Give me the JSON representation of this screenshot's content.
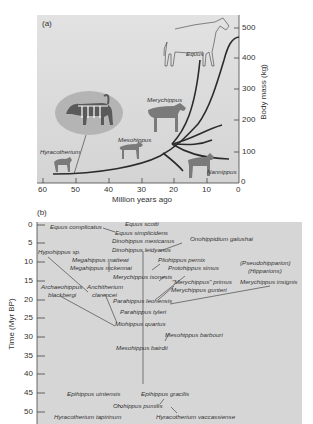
{
  "panel_a": {
    "label": "(a)",
    "xlabel": "Million years ago",
    "ylabel": "Body mass (kg)",
    "x_ticks": [
      "60",
      "50",
      "40",
      "30",
      "20",
      "10",
      "0"
    ],
    "y_ticks": [
      "500",
      "400",
      "300",
      "200",
      "100",
      "0"
    ],
    "taxa": {
      "equus": "Equus",
      "merychippus": "Merychippus",
      "mesohippus": "Mesohippus",
      "hyracotherium": "Hyracotherium",
      "nannippus": "Nannippus"
    }
  },
  "panel_b": {
    "label": "(b)",
    "ylabel": "Time (Myr BP)",
    "y_ticks": [
      "0",
      "5",
      "10",
      "15",
      "20",
      "25",
      "30",
      "35",
      "40",
      "45",
      "50"
    ],
    "taxa": {
      "equus_complicatus": "Equus complicatus",
      "equus_scotti": "Equus scotti",
      "equus_simplicidens": "Equus simplicidens",
      "dinohippus_mexicanus": "Dinohippus mexicanus",
      "dinohippus_leidyanus": "Dinohippus leidyanus",
      "onohippidium_galushai": "Onohippidium galushai",
      "hypohippus": "Hypohippus sp.",
      "megahippus_mattewi": "Megahippus mattewi",
      "megahippus_mckennai": "Megahippus mckennai",
      "pliohippus_pernix": "Pliohippus pernix",
      "protohippus_simus": "Protohippus simus",
      "pseudhipparion": "(Pseudohipparion)",
      "hipparions": "(Hipparions)",
      "merychippus_isonesis": "Merychippus isonesis",
      "archaeohippus_1": "Archaeohippus",
      "archaeohippus_2": "blackbergi",
      "anchitherium_1": "Anchitherium",
      "anchitherium_2": "clarencei",
      "merychippus_primus": "\"Merychippus\" primus",
      "merychippus_insignis": "Merychippus insignis",
      "merychippus_gunteri": "Merychippus gunteri",
      "parahippus_leonensis": "Parahippus leonensis",
      "parahippus_tyleri": "Parahippus tyleri",
      "miohippus_quartus": "Miohippus quartus",
      "mesohippus_barbouri": "Mesohippus barbouri",
      "mesohippus_bairdii": "Mesohippus bairdii",
      "epihippus_uintensis": "Epihippus uintensis",
      "epihippus_gracilis": "Epihippus gracilis",
      "orohippus_pumilis": "Orohippus pumilis",
      "hyracotherium_tapirinum": "Hyracotherium tapirinum",
      "hyracotherium_vaccassiense": "Hyracotherium vaccassiense"
    }
  },
  "colors": {
    "panel_bg": "#d9d9d9",
    "curve": "#2b2b2b",
    "animal": "#7a7a7a"
  }
}
